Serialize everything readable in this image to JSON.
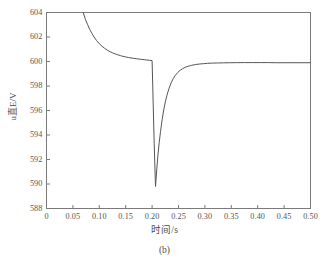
{
  "figure": {
    "caption": "(b)",
    "xaxis_title": "时间/s",
    "yaxis_title": "u直E/V"
  },
  "chart_data": {
    "type": "line",
    "title": "",
    "subtitle": "",
    "xlabel": "时间/s",
    "ylabel": "u直E/V",
    "xlim": [
      0,
      0.5
    ],
    "ylim": [
      588,
      604
    ],
    "grid": false,
    "legend": null,
    "legend_position": "none",
    "line_color": "#555555",
    "xticks": [
      "0",
      "0.05",
      "0.10",
      "0.15",
      "0.20",
      "0.25",
      "0.30",
      "0.35",
      "0.40",
      "0.45",
      "0.50"
    ],
    "xtick_values": [
      0,
      0.05,
      0.1,
      0.15,
      0.2,
      0.25,
      0.3,
      0.35,
      0.4,
      0.45,
      0.5
    ],
    "yticks": [
      "588",
      "590",
      "592",
      "594",
      "596",
      "598",
      "600",
      "602",
      "604"
    ],
    "ytick_values": [
      588,
      590,
      592,
      594,
      596,
      598,
      600,
      602,
      604
    ],
    "annotations": [
      "curve enters plot at top border near t=0.065 s above 604 V",
      "steady plateau at 600 V before fault",
      "vertical fault drop at t=0.200 s",
      "minimum 589.8 V at t=0.206 s",
      "exponential recovery settling at 599.9 V"
    ],
    "series": [
      {
        "name": "u直E",
        "x": [
          0.065,
          0.068,
          0.071,
          0.074,
          0.078,
          0.082,
          0.086,
          0.09,
          0.095,
          0.1,
          0.105,
          0.11,
          0.115,
          0.12,
          0.125,
          0.13,
          0.135,
          0.14,
          0.145,
          0.15,
          0.155,
          0.16,
          0.165,
          0.17,
          0.175,
          0.18,
          0.185,
          0.19,
          0.195,
          0.1999,
          0.2,
          0.201,
          0.202,
          0.203,
          0.204,
          0.205,
          0.206,
          0.2065,
          0.2075,
          0.209,
          0.211,
          0.2135,
          0.216,
          0.219,
          0.222,
          0.225,
          0.2285,
          0.232,
          0.236,
          0.24,
          0.244,
          0.2485,
          0.253,
          0.258,
          0.263,
          0.269,
          0.275,
          0.282,
          0.289,
          0.297,
          0.305,
          0.314,
          0.324,
          0.335,
          0.347,
          0.36,
          0.375,
          0.39,
          0.405,
          0.42,
          0.435,
          0.45,
          0.465,
          0.48,
          0.5
        ],
        "y": [
          604.6,
          604.2,
          603.8,
          603.4,
          603.0,
          602.6,
          602.3,
          602.0,
          601.7,
          601.45,
          601.25,
          601.08,
          600.93,
          600.81,
          600.71,
          600.62,
          600.55,
          600.48,
          600.42,
          600.37,
          600.33,
          600.29,
          600.26,
          600.23,
          600.2,
          600.17,
          600.15,
          600.12,
          600.1,
          600.08,
          600.05,
          598.4,
          596.6,
          594.9,
          593.3,
          591.8,
          590.4,
          589.8,
          590.4,
          591.3,
          592.35,
          593.4,
          594.3,
          595.25,
          596.05,
          596.7,
          597.3,
          597.8,
          598.25,
          598.6,
          598.88,
          599.1,
          599.28,
          599.42,
          599.53,
          599.62,
          599.69,
          599.75,
          599.79,
          599.82,
          599.85,
          599.87,
          599.88,
          599.89,
          599.9,
          599.905,
          599.91,
          599.91,
          599.91,
          599.91,
          599.9,
          599.9,
          599.9,
          599.9,
          599.9
        ]
      }
    ]
  }
}
